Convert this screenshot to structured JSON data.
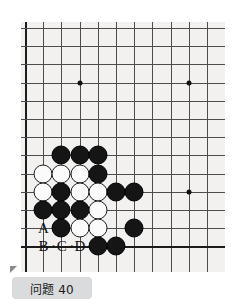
{
  "diagram": {
    "kind": "go-problem",
    "board": {
      "columns": 11,
      "rows": 13,
      "spacing": 18.2,
      "origin_x": 4,
      "origin_y": 6,
      "left_edge_column": 0,
      "bottom_edge_row": 12,
      "background_color": "#f2f1ef",
      "line_color": "#4d4d4d",
      "edge_color": "#1c1c1c",
      "star_points": [
        {
          "col": 3,
          "row": 3
        },
        {
          "col": 9,
          "row": 3
        },
        {
          "col": 9,
          "row": 9
        }
      ]
    },
    "stones": [
      {
        "col": 2,
        "row": 7,
        "color": "black"
      },
      {
        "col": 3,
        "row": 7,
        "color": "black"
      },
      {
        "col": 4,
        "row": 7,
        "color": "black"
      },
      {
        "col": 1,
        "row": 8,
        "color": "white"
      },
      {
        "col": 2,
        "row": 8,
        "color": "white"
      },
      {
        "col": 3,
        "row": 8,
        "color": "white"
      },
      {
        "col": 4,
        "row": 8,
        "color": "black"
      },
      {
        "col": 1,
        "row": 9,
        "color": "white"
      },
      {
        "col": 2,
        "row": 9,
        "color": "black"
      },
      {
        "col": 3,
        "row": 9,
        "color": "white"
      },
      {
        "col": 4,
        "row": 9,
        "color": "white"
      },
      {
        "col": 5,
        "row": 9,
        "color": "black"
      },
      {
        "col": 6,
        "row": 9,
        "color": "black"
      },
      {
        "col": 1,
        "row": 10,
        "color": "black"
      },
      {
        "col": 2,
        "row": 10,
        "color": "black"
      },
      {
        "col": 3,
        "row": 10,
        "color": "black"
      },
      {
        "col": 4,
        "row": 10,
        "color": "white"
      },
      {
        "col": 2,
        "row": 11,
        "color": "black"
      },
      {
        "col": 3,
        "row": 11,
        "color": "white"
      },
      {
        "col": 4,
        "row": 11,
        "color": "white"
      },
      {
        "col": 6,
        "row": 11,
        "color": "black"
      },
      {
        "col": 4,
        "row": 12,
        "color": "black"
      },
      {
        "col": 5,
        "row": 12,
        "color": "black"
      }
    ],
    "point_labels": [
      {
        "text": "A",
        "col": 1,
        "row": 11
      },
      {
        "text": "B",
        "col": 1,
        "row": 12
      },
      {
        "text": "·",
        "col": 1.55,
        "row": 12
      },
      {
        "text": "C",
        "col": 2,
        "row": 12
      },
      {
        "text": "·",
        "col": 2.55,
        "row": 12
      },
      {
        "text": "D",
        "col": 3,
        "row": 12
      }
    ]
  },
  "caption": {
    "text": "问题 40",
    "background_color": "#d9dbdc"
  }
}
